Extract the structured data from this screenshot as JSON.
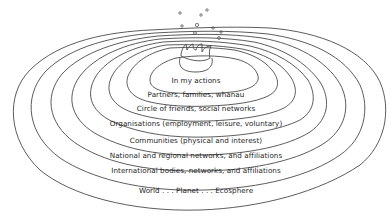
{
  "diagram": {
    "type": "concentric-ripples",
    "center_element": "water-drop-splash",
    "line_color": "#4a4a4a",
    "text_color": "#1e1e1e",
    "background": "#ffffff",
    "rings": [
      {
        "label": "In my actions"
      },
      {
        "label": "Partners, families, whanau"
      },
      {
        "label": "Circle of friends, social networks"
      },
      {
        "label": "Organisations (employment, leisure, voluntary)"
      },
      {
        "label": "Communities (physical and interest)"
      },
      {
        "label": "National and regional networks, and affiliations"
      },
      {
        "label": "International bodies, networks, and affiliations"
      },
      {
        "label": "World . . . Planet . . . Ecosphere"
      }
    ]
  }
}
